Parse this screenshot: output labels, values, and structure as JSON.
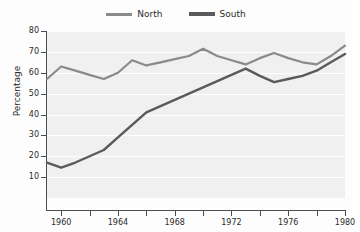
{
  "chart_data": {
    "type": "line",
    "title": "",
    "xlabel": "",
    "ylabel": "Percentage",
    "x": [
      1959,
      1960,
      1961,
      1962,
      1963,
      1964,
      1965,
      1966,
      1967,
      1968,
      1969,
      1970,
      1971,
      1972,
      1973,
      1974,
      1975,
      1976,
      1977,
      1978,
      1979,
      1980
    ],
    "series": [
      {
        "name": "North",
        "color": "#8a8a8a",
        "values": [
          57,
          63,
          61,
          59,
          57,
          60,
          66,
          63.5,
          65,
          66.5,
          68,
          71.5,
          68,
          66,
          64,
          67,
          69.5,
          67,
          65,
          64,
          68,
          73
        ]
      },
      {
        "name": "South",
        "color": "#5a5a5a",
        "values": [
          17,
          14.5,
          17,
          20,
          23,
          29,
          35,
          41,
          44,
          47,
          50,
          53,
          56,
          59,
          62,
          58.5,
          55.5,
          57,
          58.5,
          61,
          65,
          69
        ]
      }
    ],
    "xlim": [
      1959,
      1980
    ],
    "ylim": [
      0,
      80
    ],
    "yticks": [
      10,
      20,
      30,
      40,
      50,
      60,
      70,
      80
    ],
    "xticks": [
      1960,
      1962,
      1964,
      1966,
      1968,
      1970,
      1972,
      1974,
      1976,
      1978,
      1980
    ],
    "xtick_labels": [
      "1960",
      "",
      "1964",
      "",
      "1968",
      "",
      "1972",
      "",
      "1976",
      "",
      "1980"
    ],
    "grid": true,
    "grid_color": "#ffffff",
    "plot_background": "#f0f0f0",
    "legend_position": "top-center"
  },
  "legend": {
    "entries": [
      {
        "label": "North"
      },
      {
        "label": "South"
      }
    ]
  },
  "axes": {
    "ylabel": "Percentage",
    "ytick_labels": [
      "10",
      "20",
      "30",
      "40",
      "50",
      "60",
      "70",
      "80"
    ],
    "xtick_labels": [
      "1960",
      "1964",
      "1968",
      "1972",
      "1976",
      "1980"
    ]
  }
}
